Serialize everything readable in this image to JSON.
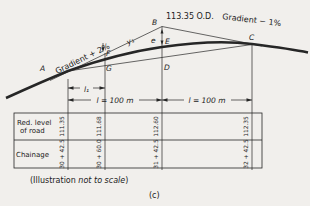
{
  "colors": {
    "paper": "#f1efec",
    "ink": "#262626"
  },
  "diagram": {
    "gradient_left": "Gradient + 2%",
    "gradient_right": "Gradient − 1%",
    "od_label": "113.35 O.D.",
    "offset_y1": "y₁",
    "offset_e": "e",
    "dim_l1": "l₁",
    "dim_left": "l = 100 m",
    "dim_right": "l = 100 m",
    "points": {
      "A": "A",
      "B": "B",
      "C": "C",
      "D": "D",
      "E": "E",
      "F": "F",
      "G": "G"
    }
  },
  "table": {
    "row1_label_line1": "Red. level",
    "row1_label_line2": "of road",
    "row2_label": "Chainage",
    "reduced_levels": [
      "111.35",
      "111.68",
      "112.60",
      "112.35"
    ],
    "chainages": [
      "30 + 42.5",
      "30 + 60.0",
      "31 + 42.5",
      "32 + 42.5"
    ]
  },
  "footer": {
    "note_prefix": "(Illustration ",
    "note_italic": "not to scale",
    "note_suffix": ")",
    "caption": "(c)"
  }
}
